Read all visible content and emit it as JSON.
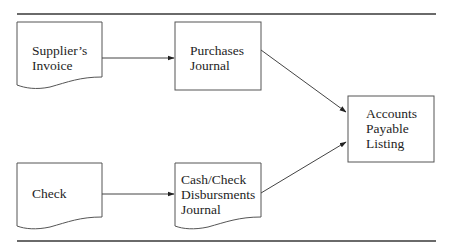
{
  "diagram": {
    "type": "flowchart",
    "colors": {
      "stroke": "#555555",
      "rule": "#6a6a6a",
      "text": "#1e1e1e",
      "background": "#ffffff"
    },
    "nodes": [
      {
        "id": "suppliers-invoice",
        "shape": "document",
        "lines": [
          "Supplier’s",
          "Invoice"
        ]
      },
      {
        "id": "purchases-journal",
        "shape": "rectangle",
        "lines": [
          "Purchases",
          "Journal"
        ]
      },
      {
        "id": "accounts-payable-listing",
        "shape": "rectangle",
        "lines": [
          "Accounts",
          "Payable",
          "Listing"
        ]
      },
      {
        "id": "check",
        "shape": "document",
        "lines": [
          "Check"
        ]
      },
      {
        "id": "cash-check-disbursments-journal",
        "shape": "document",
        "lines": [
          "Cash/Check",
          "Disbursments",
          "Journal"
        ]
      }
    ],
    "edges": [
      {
        "from": "suppliers-invoice",
        "to": "purchases-journal"
      },
      {
        "from": "purchases-journal",
        "to": "accounts-payable-listing"
      },
      {
        "from": "check",
        "to": "cash-check-disbursments-journal"
      },
      {
        "from": "cash-check-disbursments-journal",
        "to": "accounts-payable-listing"
      }
    ]
  }
}
